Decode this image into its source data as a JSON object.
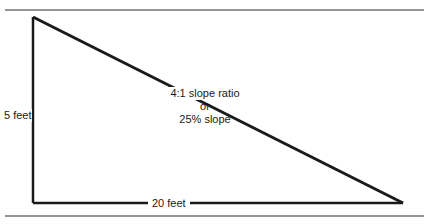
{
  "diagram": {
    "type": "right-triangle-slope",
    "labels": {
      "height": "5 feet",
      "base": "20 feet",
      "slope_line1": "4:1 slope ratio",
      "slope_line2": "or",
      "slope_line3": "25% slope"
    },
    "colors": {
      "line": "#1a1a1a",
      "background": "#ffffff"
    }
  }
}
